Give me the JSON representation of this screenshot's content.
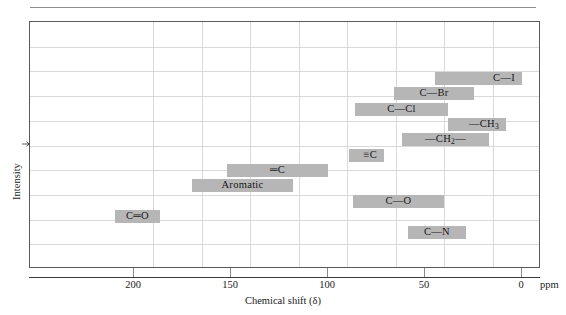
{
  "figure": {
    "top_rule": "horizontal-rule",
    "x_axis_title": "Chemical shift (δ)",
    "y_axis_title": "Intensity",
    "y_axis_arrow": "arrow-right-icon",
    "unit_label": "ppm"
  },
  "chart_data": {
    "type": "bar",
    "orientation": "horizontal-ranges",
    "title": "",
    "xlabel": "Chemical shift (δ)",
    "ylabel": "Intensity",
    "unit": "ppm",
    "xlim": [
      215,
      -5
    ],
    "x_reversed": true,
    "xticks": [
      200,
      150,
      100,
      50,
      0
    ],
    "xtick_labels": [
      "200",
      "150",
      "100",
      "50",
      "0"
    ],
    "grid": true,
    "grid_vertical_ppm": [
      190,
      165,
      140,
      115,
      90,
      65,
      40,
      15
    ],
    "grid_horizontal_count": 9,
    "legend": "none",
    "bar_color": "#b6b6b6",
    "categories": [
      "C—I",
      "C—Br",
      "C—Cl",
      "—CH3",
      "—CH2—",
      "≡C",
      "═C",
      "Aromatic",
      "C—O",
      "C═O",
      "C—N"
    ],
    "ranges": [
      {
        "label": "C—I",
        "label_html": "C—I",
        "start_ppm": 45,
        "end_ppm": 0,
        "row": 3,
        "label_align": "right"
      },
      {
        "label": "C—Br",
        "label_html": "C—Br",
        "start_ppm": 66,
        "end_ppm": 25,
        "row": 4,
        "label_align": "center"
      },
      {
        "label": "C—Cl",
        "label_html": "C—Cl",
        "start_ppm": 86,
        "end_ppm": 38,
        "row": 5,
        "label_align": "center"
      },
      {
        "label": "—CH3",
        "label_html": "—CH<sub>3</sub>",
        "start_ppm": 38,
        "end_ppm": 8,
        "row": 6,
        "label_align": "right"
      },
      {
        "label": "—CH2—",
        "label_html": "—CH<sub>2</sub>—",
        "start_ppm": 62,
        "end_ppm": 17,
        "row": 7,
        "label_align": "center"
      },
      {
        "label": "≡C",
        "label_html": "≡C",
        "start_ppm": 89,
        "end_ppm": 71,
        "row": 8,
        "label_align": "right"
      },
      {
        "label": "═C",
        "label_html": "═C",
        "start_ppm": 152,
        "end_ppm": 100,
        "row": 9,
        "label_align": "center"
      },
      {
        "label": "Aromatic",
        "label_html": "Aromatic",
        "start_ppm": 170,
        "end_ppm": 118,
        "row": 10,
        "label_align": "center"
      },
      {
        "label": "C—O",
        "label_html": "C—O",
        "start_ppm": 87,
        "end_ppm": 40,
        "row": 11,
        "label_align": "center"
      },
      {
        "label": "C═O",
        "label_html": "C═O",
        "start_ppm": 210,
        "end_ppm": 187,
        "row": 12,
        "label_align": "center"
      },
      {
        "label": "C—N",
        "label_html": "C—N",
        "start_ppm": 59,
        "end_ppm": 29,
        "row": 13,
        "label_align": "center"
      }
    ]
  }
}
